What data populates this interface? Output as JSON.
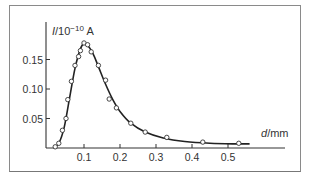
{
  "chart_data": {
    "type": "scatter",
    "title": "",
    "xlabel": "d/mm",
    "ylabel": "I/10^-10 A",
    "ylabel_display": "I/10⁻¹⁰ A",
    "xlim": [
      0,
      0.57
    ],
    "ylim": [
      0,
      0.19
    ],
    "x_ticks": [
      0.1,
      0.2,
      0.3,
      0.4,
      0.5
    ],
    "x_tick_labels": [
      "0.1",
      "0.2",
      "0.3",
      "0.4",
      "0.5"
    ],
    "y_ticks": [
      0.05,
      0.1,
      0.15
    ],
    "y_tick_labels": [
      "0.05",
      "0.10",
      "0.15"
    ],
    "grid": false,
    "legend": null,
    "series": [
      {
        "name": "measured",
        "marker": "open-circle",
        "x": [
          0.02,
          0.03,
          0.04,
          0.05,
          0.055,
          0.065,
          0.075,
          0.085,
          0.09,
          0.1,
          0.11,
          0.12,
          0.14,
          0.16,
          0.17,
          0.19,
          0.23,
          0.27,
          0.33,
          0.43,
          0.53
        ],
        "y": [
          0.002,
          0.008,
          0.03,
          0.05,
          0.082,
          0.113,
          0.14,
          0.155,
          0.165,
          0.178,
          0.175,
          0.163,
          0.14,
          0.115,
          0.083,
          0.068,
          0.042,
          0.027,
          0.018,
          0.01,
          0.008
        ]
      },
      {
        "name": "fit curve",
        "marker": "line",
        "x": [
          0.015,
          0.03,
          0.045,
          0.06,
          0.075,
          0.09,
          0.1,
          0.11,
          0.125,
          0.14,
          0.16,
          0.18,
          0.2,
          0.23,
          0.27,
          0.32,
          0.38,
          0.45,
          0.52,
          0.56
        ],
        "y": [
          0.0,
          0.008,
          0.035,
          0.085,
          0.135,
          0.168,
          0.177,
          0.174,
          0.16,
          0.138,
          0.108,
          0.082,
          0.062,
          0.042,
          0.027,
          0.017,
          0.011,
          0.008,
          0.007,
          0.007
        ]
      }
    ]
  }
}
